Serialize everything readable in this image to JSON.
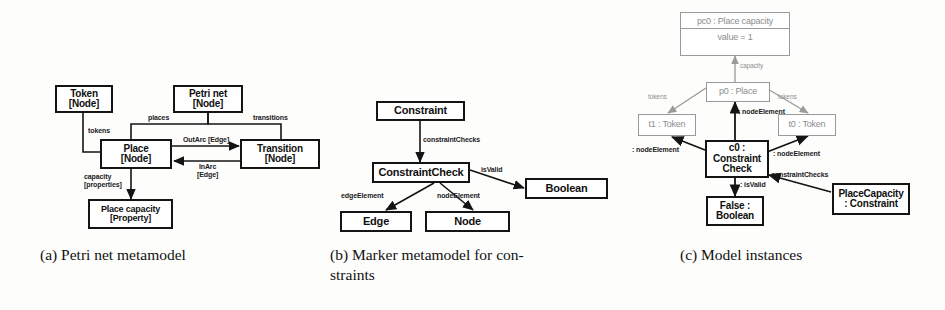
{
  "figure": {
    "background": "#fdfdfc",
    "stroke": "#141414",
    "faded_stroke": "#9a9a9a"
  },
  "panel_a": {
    "caption": "(a) Petri net metamodel",
    "boxes": {
      "token": {
        "line1": "Token",
        "line2": "[Node]"
      },
      "petrinet": {
        "line1": "Petri net",
        "line2": "[Node]"
      },
      "place": {
        "line1": "Place",
        "line2": "[Node]"
      },
      "transition": {
        "line1": "Transition",
        "line2": "[Node]"
      },
      "placecap": {
        "line1": "Place capacity",
        "line2": "[Property]"
      }
    },
    "edges": {
      "tokens": "tokens",
      "places": "places",
      "transitions": "transitions",
      "outarc": "OutArc [Edge]",
      "inarc_l1": "InArc",
      "inarc_l2": "[Edge]",
      "capacity_l1": "capacity",
      "capacity_l2": "[properties]"
    }
  },
  "panel_b": {
    "caption_line1": "(b) Marker metamodel for con-",
    "caption_line2": "straints",
    "boxes": {
      "constraint": "Constraint",
      "constraintcheck": "ConstraintCheck",
      "boolean": "Boolean",
      "edge": "Edge",
      "node": "Node"
    },
    "edges": {
      "constraintChecks": "constraintChecks",
      "isValid": "isValid",
      "edgeElement": "edgeElement",
      "nodeElement": "nodeElement"
    }
  },
  "panel_c": {
    "caption": "(c) Model instances",
    "boxes": {
      "pc0_title": "pc0 : Place capacity",
      "pc0_value": "value = 1",
      "p0": "p0 : Place",
      "t1": "t1 : Token",
      "t0": "t0 : Token",
      "c0_l1": "c0 :",
      "c0_l2": "Constraint",
      "c0_l3": "Check",
      "false_l1": "False :",
      "false_l2": "Boolean",
      "placecapacity_l1": "PlaceCapacity",
      "placecapacity_l2": ": Constraint"
    },
    "edges": {
      "capacity": "capacity",
      "tokens_left": "tokens",
      "tokens_right": "tokens",
      "nodeElement_center": ": nodeElement",
      "nodeElement_left": ": nodeElement",
      "nodeElement_right": ": nodeElement",
      "isValid": ": isValid",
      "constraintChecks": ": constraintChecks"
    }
  }
}
